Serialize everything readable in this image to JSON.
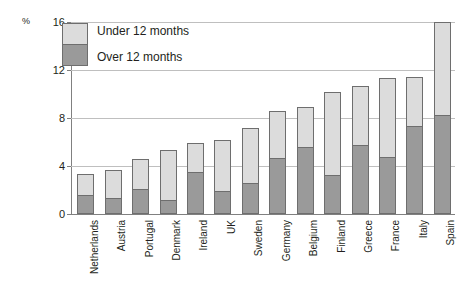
{
  "chart_data": {
    "type": "bar",
    "stacked": true,
    "title": "",
    "xlabel": "",
    "ylabel": "%",
    "ylim": [
      0,
      16
    ],
    "yticks": [
      0,
      4,
      8,
      12,
      16
    ],
    "grid": true,
    "legend_position": "top-left",
    "categories": [
      "Netherlands",
      "Austria",
      "Portugal",
      "Denmark",
      "Ireland",
      "UK",
      "Sweden",
      "Germany",
      "Belgium",
      "Finland",
      "Greece",
      "France",
      "Italy",
      "Spain"
    ],
    "series": [
      {
        "name": "Over 12 months",
        "color": "#9a9a9a",
        "values": [
          1.45,
          1.2,
          1.9,
          1.0,
          3.3,
          1.75,
          2.45,
          4.5,
          5.4,
          3.1,
          5.55,
          4.55,
          7.2,
          8.1
        ]
      },
      {
        "name": "Under 12 months",
        "color": "#dcdcdc",
        "values": [
          1.9,
          2.5,
          2.7,
          4.3,
          2.6,
          4.45,
          4.75,
          4.1,
          3.5,
          7.1,
          5.15,
          6.75,
          4.25,
          7.9
        ]
      }
    ],
    "totals": [
      3.35,
      3.7,
      4.6,
      5.3,
      5.9,
      6.2,
      7.2,
      8.6,
      8.9,
      10.2,
      10.7,
      11.3,
      11.45,
      16.0
    ]
  },
  "legend": {
    "items": [
      {
        "label": "Under 12 months"
      },
      {
        "label": "Over 12 months"
      }
    ]
  },
  "axis": {
    "unit": "%"
  }
}
